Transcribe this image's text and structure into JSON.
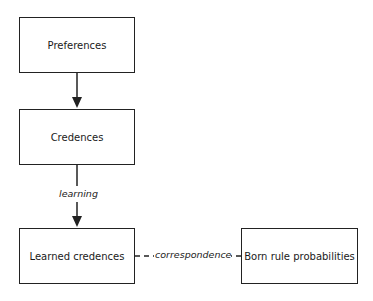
{
  "nodes": [
    {
      "id": "preferences",
      "label": "Preferences"
    },
    {
      "id": "credences",
      "label": "Credences"
    },
    {
      "id": "learned_credences",
      "label": "Learned credences"
    },
    {
      "id": "born_rule",
      "label": "Born rule probabilities"
    }
  ],
  "edges": [
    {
      "from": "preferences",
      "to": "credences",
      "label": "",
      "style": "solid-arrow"
    },
    {
      "from": "credences",
      "to": "learned_credences",
      "label": "learning",
      "style": "solid-arrow"
    },
    {
      "from": "learned_credences",
      "to": "born_rule",
      "label": "correspondence",
      "style": "dashed"
    }
  ]
}
